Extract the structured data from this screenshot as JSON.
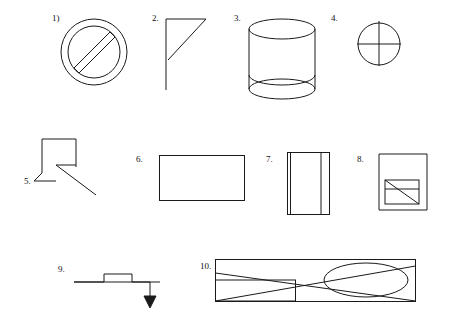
{
  "page": {
    "background_color": "#ffffff",
    "ink_color": "#1a1a1a",
    "width": 460,
    "height": 322
  },
  "figures": [
    {
      "id": 1,
      "label": "1)",
      "name": "circle-with-diagonal-bar",
      "description": "Double circle (ring) with a thick diagonal band crossing it, like a prohibition / no-entry sign",
      "label_x": 52,
      "label_y": 14
    },
    {
      "id": 2,
      "label": "2.",
      "name": "right-triangle-with-tail",
      "description": "Right triangle with horizontal top edge, vertical left edge and hypotenuse, with a vertical line continuing downward",
      "label_x": 152,
      "label_y": 14
    },
    {
      "id": 3,
      "label": "3.",
      "name": "cylinder",
      "description": "Cylinder drawn with two ellipses and two vertical side lines",
      "label_x": 234,
      "label_y": 14
    },
    {
      "id": 4,
      "label": "4.",
      "name": "circle-with-crosshair",
      "description": "Circle with vertical and horizontal diameters crossing at the center",
      "label_x": 331,
      "label_y": 14
    },
    {
      "id": 5,
      "label": "5.",
      "name": "zigzag-stair-with-diagonal",
      "description": "Stair-step polyline with a long diagonal line running to the lower right",
      "label_x": 24,
      "label_y": 178
    },
    {
      "id": 6,
      "label": "6.",
      "name": "rectangle",
      "description": "Plain rectangle (landscape orientation)",
      "label_x": 136,
      "label_y": 155
    },
    {
      "id": 7,
      "label": "7.",
      "name": "rectangular-prism-upright",
      "description": "Upright rectangle with an inner vertical line near the right edge suggesting a 3D box / book",
      "label_x": 266,
      "label_y": 155
    },
    {
      "id": 8,
      "label": "8.",
      "name": "nested-squares-with-diagonal",
      "description": "Large square with a smaller square inside the lower-left corner crossed by a diagonal",
      "label_x": 357,
      "label_y": 155
    },
    {
      "id": 9,
      "label": "9.",
      "name": "stepped-line-with-down-arrow",
      "description": "Horizontal stepped line ending in a short vertical segment with a downward arrowhead",
      "label_x": 58,
      "label_y": 266
    },
    {
      "id": 10,
      "label": "10.",
      "name": "long-rectangle-with-ellipse-and-diagonals",
      "description": "Long horizontal rectangle containing diagonal lines, a small inner rectangle on the left and a large ellipse on the right",
      "label_x": 200,
      "label_y": 262
    }
  ]
}
